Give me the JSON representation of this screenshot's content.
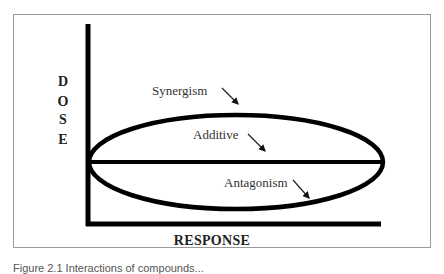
{
  "diagram": {
    "axes": {
      "y_label_letters": [
        "D",
        "O",
        "S",
        "E"
      ],
      "x_label": "RESPONSE"
    },
    "regions": [
      {
        "id": "synergism",
        "label": "Synergism"
      },
      {
        "id": "additive",
        "label": "Additive"
      },
      {
        "id": "antagonism",
        "label": "Antagonism"
      }
    ],
    "colors": {
      "line": "#000000",
      "frame": "#9a9a9a",
      "text": "#333333"
    }
  },
  "caption": {
    "text": "Figure 2.1 Interactions of compounds..."
  }
}
